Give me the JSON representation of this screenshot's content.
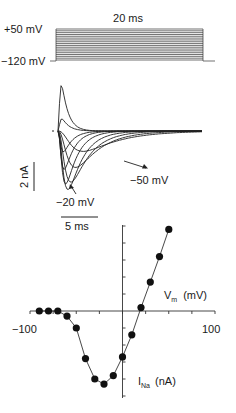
{
  "figure": {
    "protocol": {
      "duration_label": "20 ms",
      "top_label": "+50 mV",
      "bottom_label": "−120 mV",
      "holding_mV": -120,
      "step_start_mV": -120,
      "step_end_mV": 50,
      "step_increment_mV": 10,
      "steps": 18
    },
    "currents": {
      "scale_current_label": "2 nA",
      "scale_time_label": "5 ms",
      "annotations": [
        {
          "label": "−50 mV"
        },
        {
          "label": "−20 mV"
        }
      ]
    },
    "iv_plot": {
      "x_tick_label_min": "−100",
      "x_tick_label_max": "100",
      "x_axis_label_main": "V",
      "x_axis_label_sub": "m",
      "x_axis_label_unit": "(mV)",
      "y_axis_label_main": "I",
      "y_axis_label_sub": "Na",
      "y_axis_label_unit": "(nA)"
    }
  },
  "chart_data": [
    {
      "type": "line",
      "title": "Voltage-clamp step protocol",
      "xlabel": "time",
      "ylabel": "membrane potential",
      "annotations": [
        "20 ms",
        "+50 mV",
        "−120 mV"
      ],
      "x": [
        0,
        20
      ],
      "series": [
        {
          "name": "step levels (mV)",
          "values": [
            -120,
            -110,
            -100,
            -90,
            -80,
            -70,
            -60,
            -50,
            -40,
            -30,
            -20,
            -10,
            0,
            10,
            20,
            30,
            40,
            50
          ]
        }
      ]
    },
    {
      "type": "line",
      "title": "Na+ current traces",
      "xlabel": "",
      "ylabel": "",
      "annotations": [
        "2 nA",
        "5 ms",
        "−50 mV",
        "−20 mV"
      ],
      "scale_bars": {
        "current_nA": 2,
        "time_ms": 5
      },
      "series": [
        {
          "name": "-50 mV",
          "peak_nA": -1.4,
          "time_to_peak_ms": 3.2
        },
        {
          "name": "-40 mV",
          "peak_nA": -2.5,
          "time_to_peak_ms": 2.2
        },
        {
          "name": "-30 mV",
          "peak_nA": -3.5,
          "time_to_peak_ms": 1.6
        },
        {
          "name": "-20 mV",
          "peak_nA": -4.0,
          "time_to_peak_ms": 1.2
        },
        {
          "name": "-10 mV",
          "peak_nA": -3.6,
          "time_to_peak_ms": 0.9
        },
        {
          "name": "0 mV",
          "peak_nA": -2.6,
          "time_to_peak_ms": 0.7
        },
        {
          "name": "10 mV",
          "peak_nA": -1.4,
          "time_to_peak_ms": 0.6
        },
        {
          "name": "30 mV",
          "peak_nA": 0.8,
          "time_to_peak_ms": 0.4
        },
        {
          "name": "50 mV",
          "peak_nA": 3.0,
          "time_to_peak_ms": 0.35
        }
      ]
    },
    {
      "type": "scatter",
      "title": "Peak I-V relationship",
      "xlabel": "Vm (mV)",
      "ylabel": "INa (nA)",
      "xlim": [
        -100,
        100
      ],
      "x_ticks": [
        -100,
        -75,
        -50,
        -25,
        0,
        25,
        50,
        75,
        100
      ],
      "x_tick_labels": [
        "−100",
        "100"
      ],
      "y_tick_spacing_units": 1,
      "grid": false,
      "x": [
        -90,
        -80,
        -70,
        -60,
        -50,
        -40,
        -30,
        -20,
        -10,
        0,
        10,
        20,
        30,
        40,
        50
      ],
      "series": [
        {
          "name": "INa (relative, tick units)",
          "values": [
            0.0,
            0.0,
            0.0,
            -0.3,
            -1.0,
            -2.8,
            -4.0,
            -4.3,
            -3.8,
            -2.7,
            -1.4,
            0.2,
            1.7,
            3.2,
            4.8
          ]
        }
      ]
    }
  ]
}
